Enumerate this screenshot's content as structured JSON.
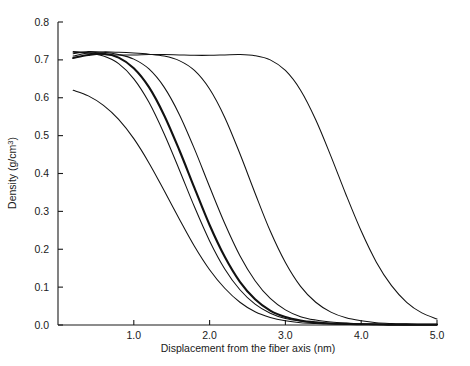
{
  "figure": {
    "background_color": "#ffffff",
    "line_color": "#111111"
  },
  "axes": {
    "x": {
      "label": "Displacement from the fiber axis (nm)",
      "ticks": [
        "1.0",
        "2.0",
        "3.0",
        "4.0",
        "5.0"
      ],
      "tick_values": [
        1.0,
        2.0,
        3.0,
        4.0,
        5.0
      ],
      "range": [
        0.0,
        5.0
      ]
    },
    "y": {
      "label_main": "Density (g/cm",
      "label_sup": "3",
      "label_close": ")",
      "label": "Density (g/cm3)",
      "ticks": [
        "0.0",
        "0.1",
        "0.2",
        "0.3",
        "0.4",
        "0.5",
        "0.6",
        "0.7",
        "0.8"
      ],
      "tick_values": [
        0.0,
        0.1,
        0.2,
        0.3,
        0.4,
        0.5,
        0.6,
        0.7,
        0.8
      ],
      "range": [
        0.0,
        0.8
      ]
    }
  },
  "chart_data": {
    "type": "line",
    "title": "",
    "xlabel": "Displacement from the fiber axis (nm)",
    "ylabel": "Density (g/cm^3)",
    "xlim": [
      0.0,
      5.0
    ],
    "ylim": [
      0.0,
      0.8
    ],
    "grid": false,
    "legend": "none",
    "x": [
      0.2,
      0.4,
      0.6,
      0.8,
      1.0,
      1.2,
      1.4,
      1.6,
      1.8,
      2.0,
      2.2,
      2.4,
      2.6,
      2.8,
      3.0,
      3.2,
      3.4,
      3.6,
      3.8,
      4.0,
      4.2,
      4.4,
      4.6,
      4.8,
      5.0
    ],
    "series": [
      {
        "name": "curve-1-smallest-radius",
        "emphasis": "normal",
        "values": [
          0.62,
          0.605,
          0.58,
          0.543,
          0.492,
          0.428,
          0.355,
          0.28,
          0.208,
          0.146,
          0.097,
          0.06,
          0.035,
          0.02,
          0.011,
          0.006,
          0.004,
          0.003,
          0.002,
          0.002,
          0.001,
          0.001,
          0.001,
          0.001,
          0.001
        ]
      },
      {
        "name": "curve-2",
        "emphasis": "normal",
        "values": [
          0.72,
          0.718,
          0.71,
          0.69,
          0.65,
          0.588,
          0.505,
          0.41,
          0.312,
          0.222,
          0.148,
          0.093,
          0.055,
          0.031,
          0.017,
          0.01,
          0.006,
          0.004,
          0.003,
          0.002,
          0.002,
          0.001,
          0.001,
          0.001,
          0.001
        ]
      },
      {
        "name": "curve-3-bold",
        "emphasis": "bold",
        "values": [
          0.705,
          0.713,
          0.716,
          0.706,
          0.678,
          0.628,
          0.554,
          0.462,
          0.362,
          0.264,
          0.18,
          0.114,
          0.068,
          0.038,
          0.021,
          0.012,
          0.007,
          0.004,
          0.003,
          0.002,
          0.002,
          0.001,
          0.001,
          0.001,
          0.001
        ]
      },
      {
        "name": "curve-4",
        "emphasis": "normal",
        "values": [
          0.716,
          0.722,
          0.72,
          0.714,
          0.702,
          0.676,
          0.628,
          0.556,
          0.465,
          0.365,
          0.268,
          0.183,
          0.117,
          0.07,
          0.04,
          0.022,
          0.013,
          0.008,
          0.005,
          0.003,
          0.002,
          0.002,
          0.001,
          0.001,
          0.001
        ]
      },
      {
        "name": "curve-5",
        "emphasis": "normal",
        "values": [
          0.71,
          0.718,
          0.721,
          0.72,
          0.718,
          0.715,
          0.71,
          0.698,
          0.672,
          0.623,
          0.548,
          0.452,
          0.348,
          0.248,
          0.165,
          0.102,
          0.06,
          0.034,
          0.019,
          0.011,
          0.006,
          0.004,
          0.003,
          0.002,
          0.002
        ]
      },
      {
        "name": "curve-6-largest-radius",
        "emphasis": "normal",
        "values": [
          0.722,
          0.719,
          0.714,
          0.713,
          0.713,
          0.714,
          0.714,
          0.713,
          0.712,
          0.712,
          0.713,
          0.714,
          0.711,
          0.7,
          0.672,
          0.62,
          0.542,
          0.446,
          0.344,
          0.248,
          0.166,
          0.104,
          0.06,
          0.032,
          0.016
        ]
      }
    ]
  }
}
